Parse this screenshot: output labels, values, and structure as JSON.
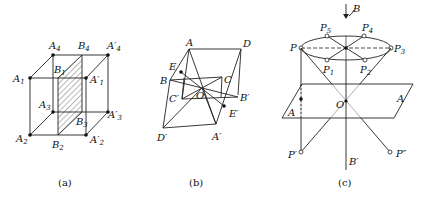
{
  "figure": {
    "panels": [
      {
        "id": "a",
        "caption": "(a)",
        "labels": [
          "A4",
          "B4",
          "A'4",
          "A1",
          "B1",
          "A'1",
          "A3",
          "A'3",
          "B3",
          "A2",
          "B2",
          "A'2"
        ]
      },
      {
        "id": "b",
        "caption": "(b)",
        "labels": [
          "A",
          "D",
          "E",
          "B",
          "C",
          "C'",
          "O",
          "B'",
          "E'",
          "D'",
          "A'"
        ]
      },
      {
        "id": "c",
        "caption": "(c)",
        "labels": [
          "B",
          "P5",
          "P4",
          "P",
          "P3",
          "P1",
          "P2",
          "A",
          "O",
          "A",
          "P'",
          "B'",
          "P''"
        ]
      }
    ]
  },
  "captions": {
    "a": "(a)",
    "b": "(b)",
    "c": "(c)"
  }
}
